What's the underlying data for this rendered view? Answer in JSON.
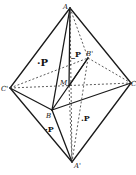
{
  "diagram": {
    "type": "crystal-octahedron-projection",
    "vertices": {
      "A": {
        "label": "A",
        "x": 70,
        "y": 8
      },
      "C1": {
        "label": "C'",
        "x": 10,
        "y": 88
      },
      "C": {
        "label": "C",
        "x": 131,
        "y": 83
      },
      "B1": {
        "label": "B'",
        "x": 88,
        "y": 58
      },
      "M": {
        "label": "M",
        "x": 69,
        "y": 86
      },
      "B": {
        "label": "B",
        "x": 52,
        "y": 110
      },
      "A1": {
        "label": "A'",
        "x": 72,
        "y": 162
      }
    },
    "face_labels": [
      {
        "text": "·P",
        "x": 38,
        "y": 65
      },
      {
        "text": "_P",
        "x": 72,
        "y": 57
      },
      {
        "text": "·P",
        "x": 46,
        "y": 132
      },
      {
        "text": ".P",
        "x": 82,
        "y": 122
      }
    ],
    "colors": {
      "line": "#1a1a1a",
      "background": "#ffffff"
    }
  }
}
